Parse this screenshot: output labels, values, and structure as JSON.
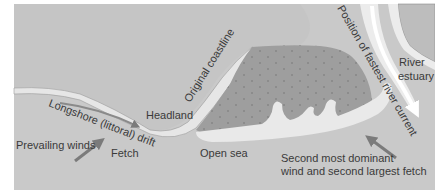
{
  "diagram": {
    "colors": {
      "sea": "#c9c9c9",
      "original_land": "#b9b9b9",
      "spit_land": "#9e9e9e",
      "beach_sand": "#e6e6e6",
      "river": "#f4f4f4",
      "arrow": "#7b7b7b",
      "text": "#3a3a3a",
      "dots": "#858585"
    },
    "labels": {
      "longshore_drift": "Longshore (littoral) drift",
      "headland": "Headland",
      "original_coastline": "Original coastline",
      "prevailing_winds": "Prevailing winds",
      "fetch": "Fetch",
      "open_sea": "Open sea",
      "fastest_current": "Position of fastest river current",
      "river_estuary_line1": "River",
      "river_estuary_line2": "estuary",
      "second_wind_line1": "Second most dominant",
      "second_wind_line2": "wind and second largest fetch"
    },
    "arrows": [
      {
        "name": "longshore-drift-arrow",
        "direction": "east"
      },
      {
        "name": "prevailing-winds-arrow",
        "direction": "north-east"
      },
      {
        "name": "river-current-arrow",
        "direction": "south"
      },
      {
        "name": "second-wind-arrow",
        "direction": "north-west"
      }
    ]
  }
}
